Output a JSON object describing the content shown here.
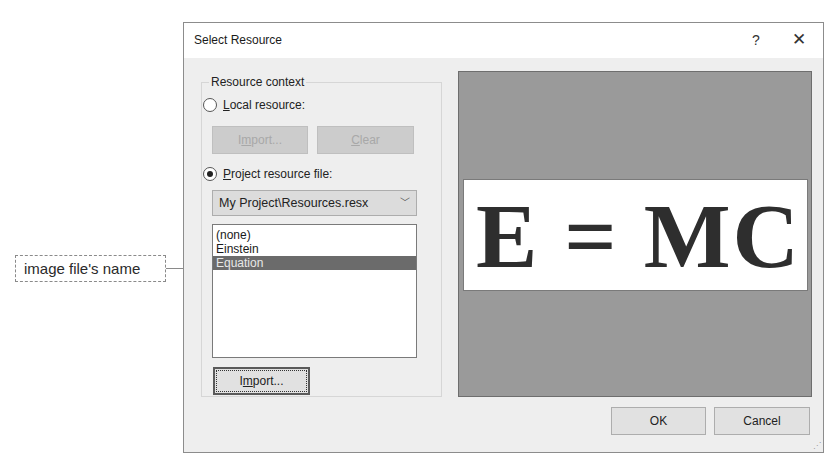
{
  "callout": {
    "label": "image file's name"
  },
  "dialog": {
    "title": "Select Resource",
    "help_label": "?",
    "close_label": "✕",
    "resource_context": {
      "legend": "Resource context",
      "local_resource": {
        "label_accel": "L",
        "label_rest": "ocal resource:",
        "checked": false
      },
      "local_import_button": {
        "label_pre": "I",
        "label_accel": "m",
        "label_rest": "port...",
        "enabled": false
      },
      "clear_button": {
        "label_accel": "C",
        "label_rest": "lear",
        "enabled": false
      },
      "project_resource": {
        "label_accel": "P",
        "label_rest": "roject resource file:",
        "checked": true
      },
      "resource_file_combo": {
        "selected": "My Project\\Resources.resx",
        "arrow": "﹀"
      },
      "resources_list": {
        "items": [
          "(none)",
          "Einstein",
          "Equation"
        ],
        "selected_index": 2
      },
      "project_import_button": {
        "label_pre": "I",
        "label_accel": "m",
        "label_rest": "port..."
      }
    },
    "preview": {
      "image_text": "E = MC",
      "background_color": "#9a9a9a"
    },
    "ok_label": "OK",
    "cancel_label": "Cancel"
  }
}
